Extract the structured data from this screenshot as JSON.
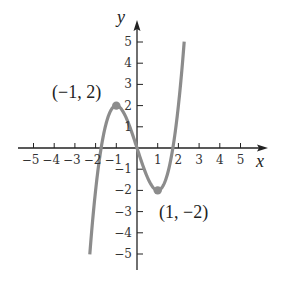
{
  "chart_data": {
    "type": "line",
    "title": "",
    "function": "y = x^3 - 3x",
    "xlabel": "x",
    "ylabel": "y",
    "xlim": [
      -5,
      5
    ],
    "ylim": [
      -5,
      5
    ],
    "x_ticks": [
      -5,
      -4,
      -3,
      -2,
      -1,
      1,
      2,
      3,
      4,
      5
    ],
    "x_tick_labels": [
      "−5",
      "−4",
      "−3",
      "−2",
      "−1",
      "1",
      "2",
      "3",
      "4",
      "5"
    ],
    "y_ticks": [
      5,
      4,
      3,
      2,
      1,
      -1,
      -2,
      -3,
      -4,
      -5
    ],
    "y_tick_labels": [
      "5",
      "4",
      "3",
      "2",
      "1",
      "−1",
      "−2",
      "−3",
      "−4",
      "−5"
    ],
    "grid": false,
    "series": [
      {
        "name": "curve",
        "color": "#8c8c8c",
        "x_range": [
          -2.28,
          2.28
        ],
        "x": [
          -2.28,
          -2,
          -1.5,
          -1,
          -0.5,
          0,
          0.5,
          1,
          1.5,
          2,
          2.28
        ],
        "y": [
          -5.0,
          -2,
          1.125,
          2,
          1.375,
          0,
          -1.375,
          -2,
          -1.125,
          2,
          5.0
        ]
      }
    ],
    "annotations": [
      {
        "text": "(−1, 2)",
        "x": -1,
        "y": 2,
        "marker": true
      },
      {
        "text": "(1, −2)",
        "x": 1,
        "y": -2,
        "marker": true
      }
    ]
  }
}
